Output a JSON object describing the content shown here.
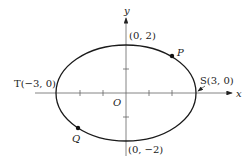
{
  "diagram": {
    "type": "ellipse-on-axes",
    "equation_implied": "x^2/9 + y^2/4 = 1",
    "axes": {
      "x_label": "x",
      "y_label": "y",
      "origin_label": "O"
    },
    "points": {
      "top": {
        "label": "(0, 2)"
      },
      "bottom": {
        "label": "(0, −2)"
      },
      "left": {
        "name": "T",
        "label": "T(−3, 0)"
      },
      "right": {
        "name": "S",
        "label": "S(3, 0)"
      },
      "P": {
        "label": "P"
      },
      "Q": {
        "label": "Q"
      }
    },
    "colors": {
      "curve": "#1a1a1a",
      "axis": "#555555",
      "text": "#222222"
    }
  }
}
